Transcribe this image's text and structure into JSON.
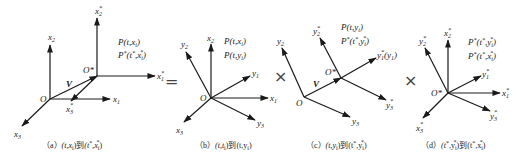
{
  "figure": {
    "operators": {
      "equals": "=",
      "times1": "×",
      "times2": "×"
    },
    "panels": [
      {
        "id": "a",
        "caption": {
          "tag": "（a）",
          "from": "(t,x",
          "from_sub": "i",
          "from_end": ")",
          "to_word": "到",
          "to": "(t",
          "to_sup": "*",
          "to_mid": ",x",
          "to_sub": "i",
          "to_sup2": "*",
          "to_end": ")"
        },
        "points": [
          "P(t,x",
          "i",
          ")",
          "P",
          "*",
          "(t",
          "*",
          ",x",
          "i",
          "*",
          ")"
        ],
        "labels": {
          "origin": "O",
          "origin_star": "O*",
          "vector": "V",
          "x1": "x",
          "x1_sub": "1",
          "x2": "x",
          "x2_sub": "2",
          "x3": "x",
          "x3_sub": "3",
          "x1s": "x",
          "x1s_sub": "1",
          "x1s_sup": "*",
          "x2s": "x",
          "x2s_sub": "2",
          "x2s_sup": "*",
          "x3s": "x",
          "x3s_sub": "3",
          "x3s_sup": "*"
        }
      },
      {
        "id": "b",
        "caption": {
          "tag": "（b）",
          "text": "(t,t",
          "sub": "i",
          "end": ")到(t,y",
          "sub2": "i",
          "end2": ")"
        },
        "points": [
          "P(t,x",
          "i",
          ")",
          "P(t,y",
          "i",
          ")"
        ],
        "labels": {
          "origin": "O",
          "x1": "x",
          "x1_sub": "1",
          "x2": "x",
          "x2_sub": "2",
          "x3": "x",
          "x3_sub": "3",
          "y1": "y",
          "y1_sub": "1",
          "y2": "y",
          "y2_sub": "2",
          "y3": "y",
          "y3_sub": "3"
        }
      },
      {
        "id": "c",
        "caption": {
          "tag": "（c）",
          "text": "(t,y",
          "sub": "i",
          "end": ")到(t",
          "sup": "*",
          "mid": ",y",
          "sub2": "i",
          "sup2": "*",
          "end2": ")"
        },
        "points": [
          "P(t,y",
          "i",
          ")",
          "P",
          "*",
          "(t",
          "*",
          ",y",
          "i",
          "*",
          ")"
        ],
        "labels": {
          "origin": "O",
          "origin_star": "O*",
          "vector": "V",
          "y2": "y",
          "y2_sub": "2",
          "y3": "y",
          "y3_sub": "3",
          "y1s": "y",
          "y1s_sub": "1",
          "y1s_sup": "*",
          "y1s_extra": "(y",
          "y1s_extra_sub": "1",
          "y1s_extra_end": ")",
          "y2s": "y",
          "y2s_sub": "2",
          "y2s_sup": "*",
          "y3s": "y",
          "y3s_sub": "3",
          "y3s_sup": "*"
        }
      },
      {
        "id": "d",
        "caption": {
          "tag": "（d）",
          "text": "(t",
          "sup": "*",
          "mid": ",y",
          "sub": "i",
          "sup2": "*",
          "end": ")到(t",
          "sup3": "*",
          "mid2": ",x",
          "sub2": "i",
          "sup4": "*",
          "end2": ")"
        },
        "points": [
          "P",
          "*",
          "(t",
          "*",
          ",y",
          "i",
          "*",
          ")",
          "P",
          "*",
          "(t",
          "*",
          ",x",
          "i",
          "*",
          ")"
        ],
        "labels": {
          "origin_star": "O*",
          "x1s": "x",
          "x1s_sub": "1",
          "x1s_sup": "*",
          "x2s": "x",
          "x2s_sub": "2",
          "x2s_sup": "*",
          "x3s": "x",
          "x3s_sub": "3",
          "x3s_sup": "*",
          "y1s": "y",
          "y1s_sub": "1",
          "y1s_sup": "*",
          "y2s": "y",
          "y2s_sub": "2",
          "y2s_sup": "*",
          "y3s": "y",
          "y3s_sub": "3",
          "y3s_sup": "*"
        }
      }
    ]
  }
}
